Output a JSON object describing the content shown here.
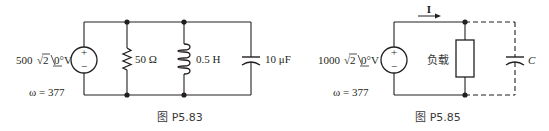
{
  "figures": [
    {
      "id": "P5.83",
      "caption": "图 P5.83",
      "source": {
        "magnitude": "500",
        "sqrt": "√2",
        "radicand": "2",
        "angle": "0°",
        "unit": "V",
        "plus": "+",
        "minus": "−"
      },
      "omega": "ω = 377",
      "components": [
        {
          "type": "resistor",
          "label": "50 Ω"
        },
        {
          "type": "inductor",
          "label": "0.5 H"
        },
        {
          "type": "capacitor",
          "label": "10 μF"
        }
      ]
    },
    {
      "id": "P5.85",
      "caption": "图 P5.85",
      "source": {
        "magnitude": "1000",
        "sqrt": "√2",
        "radicand": "2",
        "angle": "0°",
        "unit": "V",
        "plus": "+",
        "minus": "−"
      },
      "omega": "ω = 377",
      "current_label": "I",
      "components": [
        {
          "type": "load",
          "label": "负载"
        },
        {
          "type": "capacitor",
          "label": "C",
          "connection": "dashed"
        }
      ]
    }
  ],
  "colors": {
    "stroke": "#231f20",
    "background": "#ffffff"
  }
}
